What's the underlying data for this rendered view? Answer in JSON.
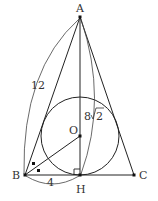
{
  "diagram": {
    "type": "geometry",
    "points": {
      "A": {
        "label": "A",
        "x": 80,
        "y": 17
      },
      "B": {
        "label": "B",
        "x": 25,
        "y": 175
      },
      "C": {
        "label": "C",
        "x": 134,
        "y": 175
      },
      "H": {
        "label": "H",
        "x": 80,
        "y": 175
      },
      "O": {
        "label": "O",
        "x": 80,
        "y": 136
      }
    },
    "circle": {
      "center": "O",
      "radius": 39
    },
    "measurements": {
      "AB": "12",
      "BH": "4",
      "AH_prefix": "8",
      "AH_radical": "2"
    },
    "marks": {
      "right_angle": "H",
      "equal_angles": "B"
    },
    "colors": {
      "stroke": "#222222",
      "text": "#333333",
      "background": "#ffffff"
    }
  }
}
